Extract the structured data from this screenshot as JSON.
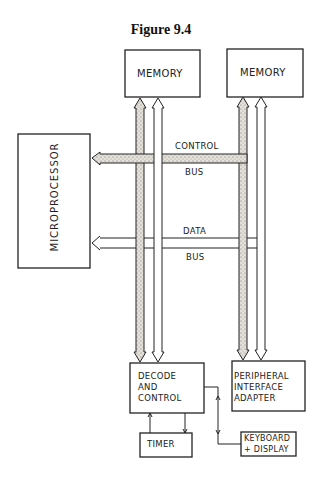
{
  "figure": {
    "title": "Figure 9.4"
  },
  "blocks": {
    "memory_1": "MEMORY",
    "memory_2": "MEMORY",
    "microprocessor": "MICROPROCESSOR",
    "decode_control": [
      "DECODE",
      "AND",
      "CONTROL"
    ],
    "pia": [
      "PERIPHERAL",
      "INTERFACE",
      "ADAPTER"
    ],
    "timer": "TIMER",
    "keyboard_display": [
      "KEYBOARD",
      "+ DISPLAY"
    ]
  },
  "buses": {
    "control_top": "CONTROL",
    "control_bottom": "BUS",
    "data_top": "DATA",
    "data_bottom": "BUS"
  },
  "colors": {
    "line": "#222222",
    "shade": "#d8d3cc",
    "background": "#ffffff"
  }
}
